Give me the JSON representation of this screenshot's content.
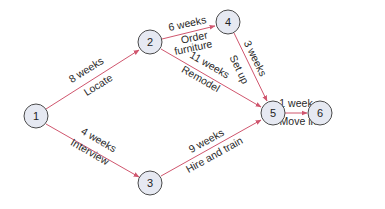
{
  "diagram": {
    "type": "network-activity-diagram",
    "colors": {
      "edge": "#d0566e",
      "node_fill": "#e6e9f2",
      "node_stroke": "#4a4a4a",
      "text": "#222222"
    },
    "nodes": [
      {
        "id": "1",
        "label": "1"
      },
      {
        "id": "2",
        "label": "2"
      },
      {
        "id": "3",
        "label": "3"
      },
      {
        "id": "4",
        "label": "4"
      },
      {
        "id": "5",
        "label": "5"
      },
      {
        "id": "6",
        "label": "6"
      }
    ],
    "edges": [
      {
        "from": "1",
        "to": "2",
        "duration": "8 weeks",
        "activity": "Locate"
      },
      {
        "from": "1",
        "to": "3",
        "duration": "4 weeks",
        "activity": "Interview"
      },
      {
        "from": "2",
        "to": "4",
        "duration": "6 weeks",
        "activity_line1": "Order",
        "activity_line2": "furniture"
      },
      {
        "from": "2",
        "to": "5",
        "duration": "11 weeks",
        "activity": "Remodel"
      },
      {
        "from": "4",
        "to": "5",
        "duration": "3 weeks",
        "activity": "Set up"
      },
      {
        "from": "3",
        "to": "5",
        "duration": "9 weeks",
        "activity": "Hire and train"
      },
      {
        "from": "5",
        "to": "6",
        "duration": "1 week",
        "activity": "Move in"
      }
    ]
  }
}
